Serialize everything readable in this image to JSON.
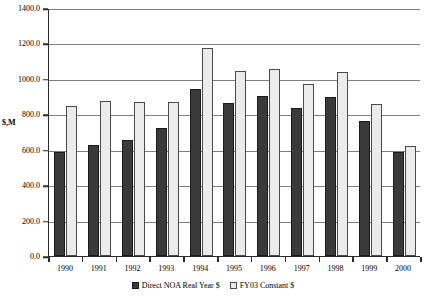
{
  "chart_data": {
    "type": "bar",
    "title": "",
    "xlabel": "",
    "ylabel": "$,M",
    "ylim": [
      0,
      1400
    ],
    "ytick_step": 200,
    "ytick_labels": [
      "1400.0",
      "1200.0",
      "1000.0",
      "800.0",
      "600.0",
      "400.0",
      "200.0",
      "0.0"
    ],
    "ytick_values": [
      1400,
      1200,
      1000,
      800,
      600,
      400,
      200,
      0
    ],
    "grid": true,
    "legend_position": "bottom",
    "categories": [
      "1990",
      "1991",
      "1992",
      "1993",
      "1994",
      "1995",
      "1996",
      "1997",
      "1998",
      "1999",
      "2000"
    ],
    "series": [
      {
        "name": "Direct NOA Real Year $",
        "color": "#3a3a3a",
        "values": [
          588,
          627,
          657,
          722,
          943,
          862,
          903,
          838,
          900,
          762,
          585
        ]
      },
      {
        "name": "FY03 Constant $",
        "color": "#ebebeb",
        "values": [
          848,
          875,
          872,
          872,
          1175,
          1043,
          1055,
          972,
          1037,
          860,
          622
        ]
      }
    ]
  },
  "legend": {
    "entries": [
      {
        "label": "Direct NOA Real Year $",
        "swatch": "dark-square-icon"
      },
      {
        "label": "FY03 Constant $",
        "swatch": "light-square-icon"
      }
    ]
  }
}
